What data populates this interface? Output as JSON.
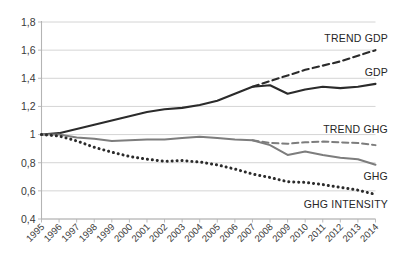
{
  "chart_data": {
    "type": "line",
    "title": "",
    "subtitle": "",
    "xlabel": "",
    "ylabel": "",
    "grid": true,
    "legend_position": "inline-right-labels",
    "decimal_separator": ",",
    "x": [
      1995,
      1996,
      1997,
      1998,
      1999,
      2000,
      2001,
      2002,
      2003,
      2004,
      2005,
      2006,
      2007,
      2008,
      2009,
      2010,
      2011,
      2012,
      2013,
      2014
    ],
    "categories": [
      "1995",
      "1996",
      "1997",
      "1998",
      "1999",
      "2000",
      "2001",
      "2002",
      "2003",
      "2004",
      "2005",
      "2006",
      "2007",
      "2008",
      "2009",
      "2010",
      "2011",
      "2012",
      "2013",
      "2014"
    ],
    "ylim": [
      0.4,
      1.8
    ],
    "yticks": [
      0.4,
      0.6,
      0.8,
      1.0,
      1.2,
      1.4,
      1.6,
      1.8
    ],
    "ytick_labels": [
      "0,4",
      "0,6",
      "0,8",
      "1",
      "1,2",
      "1,4",
      "1,6",
      "1,8"
    ],
    "series": [
      {
        "name": "GDP",
        "label": "GDP",
        "style": "solid",
        "color": "#2b2b2b",
        "width": 2.1,
        "x": [
          1995,
          1996,
          1997,
          1998,
          1999,
          2000,
          2001,
          2002,
          2003,
          2004,
          2005,
          2006,
          2007,
          2008,
          2009,
          2010,
          2011,
          2012,
          2013,
          2014
        ],
        "values": [
          1.0,
          1.01,
          1.04,
          1.07,
          1.1,
          1.13,
          1.16,
          1.18,
          1.19,
          1.21,
          1.24,
          1.29,
          1.34,
          1.35,
          1.29,
          1.32,
          1.34,
          1.33,
          1.34,
          1.36
        ]
      },
      {
        "name": "TREND GDP",
        "label": "TREND GDP",
        "style": "dashed",
        "color": "#2b2b2b",
        "width": 2.1,
        "x": [
          2007,
          2008,
          2009,
          2010,
          2011,
          2012,
          2013,
          2014
        ],
        "values": [
          1.34,
          1.38,
          1.42,
          1.46,
          1.49,
          1.52,
          1.56,
          1.6
        ]
      },
      {
        "name": "GHG",
        "label": "GHG",
        "style": "solid",
        "color": "#7d7d7d",
        "width": 2.0,
        "x": [
          1995,
          1996,
          1997,
          1998,
          1999,
          2000,
          2001,
          2002,
          2003,
          2004,
          2005,
          2006,
          2007,
          2008,
          2009,
          2010,
          2011,
          2012,
          2013,
          2014
        ],
        "values": [
          1.0,
          1.0,
          0.98,
          0.97,
          0.955,
          0.96,
          0.965,
          0.965,
          0.975,
          0.985,
          0.975,
          0.965,
          0.96,
          0.925,
          0.855,
          0.88,
          0.855,
          0.835,
          0.825,
          0.785
        ]
      },
      {
        "name": "TREND GHG",
        "label": "TREND GHG",
        "style": "dashed",
        "color": "#7d7d7d",
        "width": 2.0,
        "x": [
          2007,
          2008,
          2009,
          2010,
          2011,
          2012,
          2013,
          2014
        ],
        "values": [
          0.96,
          0.94,
          0.935,
          0.945,
          0.95,
          0.945,
          0.94,
          0.925
        ]
      },
      {
        "name": "GHG INTENSITY",
        "label": "GHG INTENSITY",
        "style": "dotted",
        "color": "#2b2b2b",
        "width": 3.0,
        "x": [
          1995,
          1996,
          1997,
          1998,
          1999,
          2000,
          2001,
          2002,
          2003,
          2004,
          2005,
          2006,
          2007,
          2008,
          2009,
          2010,
          2011,
          2012,
          2013,
          2014
        ],
        "values": [
          1.0,
          0.99,
          0.955,
          0.91,
          0.875,
          0.845,
          0.825,
          0.81,
          0.815,
          0.805,
          0.785,
          0.755,
          0.72,
          0.695,
          0.665,
          0.66,
          0.645,
          0.625,
          0.605,
          0.575
        ]
      }
    ],
    "annotations": [
      {
        "text": "TREND GDP",
        "anchor_series": "TREND GDP",
        "position": "upper-right"
      },
      {
        "text": "GDP",
        "anchor_series": "GDP",
        "position": "right"
      },
      {
        "text": "TREND GHG",
        "anchor_series": "TREND GHG",
        "position": "right"
      },
      {
        "text": "GHG",
        "anchor_series": "GHG",
        "position": "right"
      },
      {
        "text": "GHG INTENSITY",
        "anchor_series": "GHG INTENSITY",
        "position": "lower-right"
      }
    ]
  },
  "labels": {
    "trend_gdp": "TREND GDP",
    "gdp": "GDP",
    "trend_ghg": "TREND GHG",
    "ghg": "GHG",
    "ghg_intensity": "GHG INTENSITY"
  },
  "colors": {
    "gdp": "#2b2b2b",
    "ghg": "#7d7d7d",
    "grid": "#c9c9c9",
    "axis": "#b4b4b4",
    "text": "#3a3a3a",
    "background": "#ffffff"
  }
}
